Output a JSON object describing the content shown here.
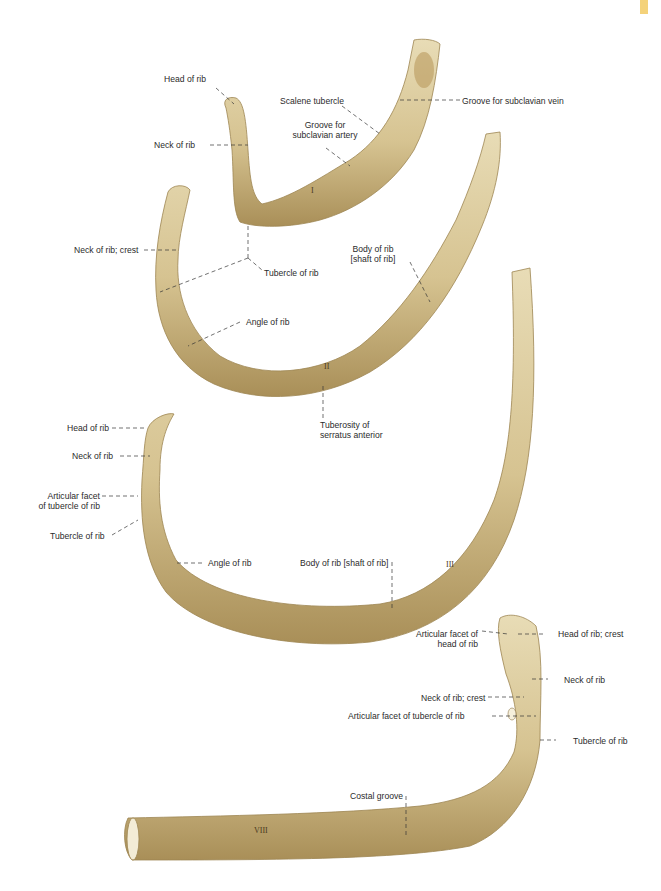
{
  "figure": {
    "page_tab_color": "#f4d27a",
    "bone_color": "#d9c89b",
    "bone_shadow": "#a88f5c",
    "ribs": [
      {
        "id": "rib-1",
        "numeral": "I",
        "labels": {
          "head": "Head of rib",
          "scalene_tubercle": "Scalene tubercle",
          "groove_vein": "Groove for subclavian vein",
          "groove_artery_1": "Groove for",
          "groove_artery_2": "subclavian artery",
          "neck": "Neck of rib"
        }
      },
      {
        "id": "rib-2",
        "numeral": "II",
        "labels": {
          "neck_crest": "Neck of rib; crest",
          "tubercle": "Tubercle of rib",
          "body_1": "Body of rib",
          "body_2": "[shaft of rib]",
          "angle": "Angle of rib",
          "tuberosity_1": "Tuberosity of",
          "tuberosity_2": "serratus anterior"
        }
      },
      {
        "id": "rib-3",
        "numeral": "III",
        "labels": {
          "head": "Head of rib",
          "neck": "Neck of rib",
          "facet_1": "Articular facet",
          "facet_2": "of tubercle of rib",
          "tubercle": "Tubercle of rib",
          "angle": "Angle of rib",
          "body": "Body of rib [shaft of rib]"
        }
      },
      {
        "id": "rib-8",
        "numeral": "VIII",
        "labels": {
          "head_facet_1": "Articular facet of",
          "head_facet_2": "head of rib",
          "head_crest": "Head of rib; crest",
          "neck": "Neck of rib",
          "neck_crest": "Neck of rib; crest",
          "tubercle_facet": "Articular facet of tubercle of rib",
          "tubercle": "Tubercle of rib",
          "costal_groove": "Costal groove"
        }
      }
    ]
  }
}
